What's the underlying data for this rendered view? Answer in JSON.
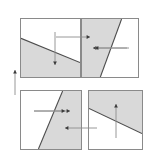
{
  "figure": {
    "title": "Four shaded half-plane regions with direction arrows",
    "width": 155,
    "height": 157,
    "background_color": "#ffffff",
    "shade_color": "#d9d9d9",
    "line_color": "#4d4d4d",
    "border_color": "#8a8a8a",
    "arrow_color": "#8c8c8c",
    "arrow_head_color": "#3a3a3a"
  },
  "panels": [
    {
      "id": "panel-top-left",
      "label": "top-left",
      "x": 20,
      "y": 18,
      "width": 61,
      "height": 60,
      "boundary": {
        "type": "line",
        "x1": 0,
        "y1": 20,
        "x2": 61,
        "y2": 45,
        "slope_description": "descending left-to-right"
      },
      "shaded_side": "below",
      "shade_polygon": "0,20 61,45 61,60 0,60",
      "arrow": {
        "name": "down-arrow",
        "direction": "down",
        "from_x": 35,
        "from_y": 14,
        "to_x": 35,
        "to_y": 47
      }
    },
    {
      "id": "panel-top-right",
      "label": "top-right",
      "x": 81,
      "y": 18,
      "width": 58,
      "height": 60,
      "boundary": {
        "type": "line",
        "x1": 19,
        "y1": 60,
        "x2": 41,
        "y2": 0,
        "slope_description": "steep ascending left-to-right"
      },
      "shaded_side": "left",
      "shade_polygon": "0,0 41,0 19,60 0,60",
      "arrow": {
        "name": "left-arrow",
        "direction": "left",
        "from_x": 48,
        "from_y": 30,
        "to_x": 12,
        "to_y": 30
      }
    },
    {
      "id": "panel-bottom-left",
      "label": "bottom-left",
      "x": 20,
      "y": 90,
      "width": 62,
      "height": 60,
      "boundary": {
        "type": "line",
        "x1": 18,
        "y1": 60,
        "x2": 43,
        "y2": 0,
        "slope_description": "steep ascending left-to-right"
      },
      "shaded_side": "right",
      "shade_polygon": "43,0 62,0 62,60 18,60",
      "arrow": {
        "name": "right-arrow",
        "direction": "right",
        "from_x": 14,
        "from_y": 21,
        "to_x": 50,
        "to_y": 21
      }
    },
    {
      "id": "panel-bottom-right",
      "label": "bottom-right",
      "x": 88,
      "y": 90,
      "width": 55,
      "height": 60,
      "boundary": {
        "type": "line",
        "x1": 0,
        "y1": 18,
        "x2": 55,
        "y2": 44,
        "slope_description": "descending left-to-right"
      },
      "shaded_side": "above",
      "shade_polygon": "0,0 55,0 55,44 0,18",
      "arrow": {
        "name": "up-arrow",
        "direction": "up",
        "from_x": 28,
        "from_y": 48,
        "to_x": 28,
        "to_y": 14
      }
    }
  ],
  "connector_arrows": [
    {
      "id": "arrow-top-cross-right",
      "name": "right-pointing-connector-arrow",
      "direction": "right",
      "from_x": 56,
      "from_y": 37,
      "to_x": 90,
      "to_y": 37
    },
    {
      "id": "arrow-top-right-inward",
      "name": "left-pointing-connector-arrow",
      "direction": "left",
      "from_x": 127,
      "from_y": 48,
      "to_x": 95,
      "to_y": 48
    },
    {
      "id": "arrow-bottom-left-inward",
      "name": "right-pointing-connector-arrow",
      "direction": "right",
      "from_x": 34,
      "from_y": 111,
      "to_x": 65,
      "to_y": 111
    },
    {
      "id": "arrow-bottom-cross-left",
      "name": "left-pointing-connector-arrow",
      "direction": "left",
      "from_x": 97,
      "from_y": 128,
      "to_x": 65,
      "to_y": 128
    },
    {
      "id": "arrow-left-margin-up",
      "name": "up-pointing-margin-arrow",
      "direction": "up",
      "from_x": 15,
      "from_y": 95,
      "to_x": 15,
      "to_y": 70
    }
  ]
}
